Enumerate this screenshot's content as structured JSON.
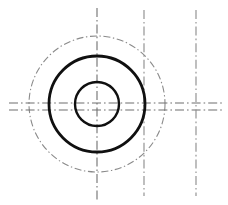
{
  "drawing": {
    "title": "Concentric Circles Technical Drawing",
    "description": "Orthographic engineering sketch showing two concentric solid circles (bore and outer diameter) with a dash-dot reference circle (bolt circle) and dash-dot centerlines.",
    "canvas": {
      "width": 228,
      "height": 205,
      "background": "#ffffff"
    },
    "colors": {
      "outline": "#101010",
      "centerline": "#6f6f6f",
      "reference_circle": "#8a8a8a",
      "background": "#ffffff"
    },
    "center": {
      "x": 97,
      "y": 104
    },
    "circles": [
      {
        "name": "bore-circle",
        "label": "inner bore circle",
        "cx": 97,
        "cy": 104,
        "r": 22,
        "stroke": "#101010",
        "stroke_width": 2.4,
        "style": "solid"
      },
      {
        "name": "outer-circle",
        "label": "outer body circle",
        "cx": 97,
        "cy": 104,
        "r": 48,
        "stroke": "#101010",
        "stroke_width": 2.8,
        "style": "solid"
      },
      {
        "name": "bolt-circle",
        "label": "dash-dot reference circle",
        "cx": 97,
        "cy": 104,
        "r": 68,
        "stroke": "#8a8a8a",
        "stroke_width": 1.1,
        "style": "dash-dot"
      }
    ],
    "centerlines": [
      {
        "name": "vertical-centerline-main",
        "orientation": "vertical",
        "x": 97,
        "y1": 8,
        "y2": 200,
        "stroke": "#6f6f6f",
        "stroke_width": 1.1,
        "style": "dash-dot"
      },
      {
        "name": "vertical-centerline-right-inner",
        "orientation": "vertical",
        "x": 144,
        "y1": 10,
        "y2": 196,
        "stroke": "#8a8a8a",
        "stroke_width": 1.1,
        "style": "dash-dot"
      },
      {
        "name": "vertical-centerline-right-outer",
        "orientation": "vertical",
        "x": 196,
        "y1": 10,
        "y2": 196,
        "stroke": "#8a8a8a",
        "stroke_width": 1.1,
        "style": "dash-dot"
      },
      {
        "name": "horizontal-centerline-upper",
        "orientation": "horizontal",
        "y": 103,
        "x1": 9,
        "x2": 222,
        "stroke": "#6f6f6f",
        "stroke_width": 1.1,
        "style": "dash-dot"
      },
      {
        "name": "horizontal-centerline-lower",
        "orientation": "horizontal",
        "y": 110,
        "x1": 9,
        "x2": 222,
        "stroke": "#6f6f6f",
        "stroke_width": 1.1,
        "style": "dash-dot"
      }
    ],
    "dash_patterns": {
      "dash_dot": "9 3 1.6 3",
      "dash_dot_fine": "7 2.6 1.4 2.6"
    }
  }
}
